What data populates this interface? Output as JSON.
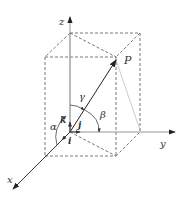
{
  "diagram": {
    "axes": {
      "x": {
        "label": "x"
      },
      "y": {
        "label": "y"
      },
      "z": {
        "label": "z"
      }
    },
    "point": {
      "label": "P"
    },
    "angles": {
      "alpha": "α",
      "beta": "β",
      "gamma": "γ"
    },
    "unit_vectors": {
      "i": "i",
      "j": "j",
      "k": "k"
    },
    "colors": {
      "line": "#333333",
      "dashed": "#555555",
      "faint": "#999999",
      "background": "#ffffff"
    }
  }
}
